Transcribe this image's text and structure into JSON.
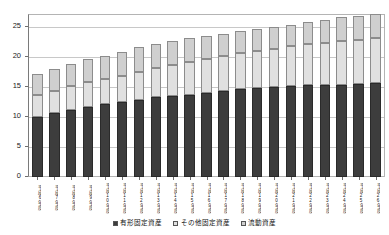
{
  "chart_data": {
    "type": "bar",
    "subtype": "stacked-vertical",
    "title": "",
    "xlabel": "",
    "ylabel": "",
    "ylim": [
      0,
      27
    ],
    "yticks": [
      0,
      5,
      10,
      15,
      20,
      25
    ],
    "ytick_labels": [
      "0",
      "5",
      "10",
      "15",
      "20",
      "25"
    ],
    "grid": true,
    "grid_axis": "y",
    "legend_position": "bottom-center",
    "categories": [
      "平成6年度",
      "平成7年度",
      "平成8年度",
      "平成9年度",
      "平成10年度",
      "平成11年度",
      "平成12年度",
      "平成13年度",
      "平成14年度",
      "平成15年度",
      "平成16年度",
      "平成17年度",
      "平成18年度",
      "平成19年度",
      "平成20年度",
      "平成21年度",
      "平成22年度",
      "平成23年度",
      "平成24年度",
      "平成25年度",
      "平成26年度"
    ],
    "series": [
      {
        "name": "有形固定資産",
        "color": "#3d3d3d",
        "values": [
          10.0,
          10.6,
          11.2,
          11.7,
          12.1,
          12.5,
          12.9,
          13.3,
          13.5,
          13.7,
          14.0,
          14.3,
          14.6,
          14.8,
          15.0,
          15.2,
          15.3,
          15.3,
          15.4,
          15.5,
          15.6
        ]
      },
      {
        "name": "その他固定資産",
        "color": "#e0e0e0",
        "values": [
          3.7,
          3.8,
          3.9,
          4.1,
          4.2,
          4.4,
          4.6,
          4.8,
          5.1,
          5.4,
          5.6,
          5.8,
          6.0,
          6.2,
          6.4,
          6.6,
          6.9,
          7.1,
          7.3,
          7.4,
          7.5
        ]
      },
      {
        "name": "流動資産",
        "color": "#cfcfcf",
        "values": [
          3.4,
          3.6,
          3.8,
          3.8,
          3.9,
          4.0,
          4.1,
          4.1,
          4.1,
          4.1,
          3.9,
          3.8,
          3.7,
          3.6,
          3.6,
          3.6,
          3.6,
          3.8,
          3.9,
          3.9,
          4.0
        ]
      }
    ],
    "totals": [
      17.1,
      18.0,
      18.9,
      19.6,
      20.2,
      20.9,
      21.6,
      22.2,
      22.7,
      23.2,
      23.5,
      23.9,
      24.3,
      24.6,
      25.0,
      25.4,
      25.8,
      26.2,
      26.6,
      26.8,
      27.1
    ]
  },
  "legend": {
    "items": [
      {
        "label": "有形固定資産",
        "color": "#3d3d3d"
      },
      {
        "label": "その他固定資産",
        "color": "#e0e0e0"
      },
      {
        "label": "流動資産",
        "color": "#cfcfcf"
      }
    ]
  }
}
